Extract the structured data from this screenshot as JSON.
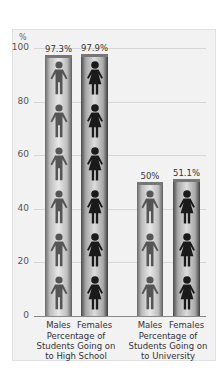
{
  "chart_data": {
    "type": "bar",
    "title": "",
    "ylabel": "%",
    "xlabel": "",
    "ylim": [
      0,
      100
    ],
    "yticks": [
      0,
      20,
      40,
      60,
      80,
      100
    ],
    "grid": true,
    "groups": [
      {
        "caption": "Percentage of Students Going on to High School",
        "caption_lines": [
          "Percentage of",
          "Students Going on",
          "to High School"
        ],
        "categories": [
          "Males",
          "Females"
        ],
        "values": [
          97.3,
          97.9
        ],
        "value_labels": [
          "97.3%",
          "97.9%"
        ]
      },
      {
        "caption": "Percentage of Students Going on to University",
        "caption_lines": [
          "Percentage of",
          "Students Going on",
          "to University"
        ],
        "categories": [
          "Males",
          "Females"
        ],
        "values": [
          50,
          51.1
        ],
        "value_labels": [
          "50%",
          "51.1%"
        ]
      }
    ],
    "icons": {
      "male": "male-figure-icon",
      "female": "female-figure-icon"
    },
    "colors": {
      "male_figure": "#555555",
      "female_figure": "#1a1a1a",
      "bar_edge": "#5e5e5e",
      "panel": "#f2f2f2"
    }
  },
  "axis": {
    "unit": "%",
    "ticks": [
      "100",
      "80",
      "60",
      "40",
      "20",
      "0"
    ]
  }
}
